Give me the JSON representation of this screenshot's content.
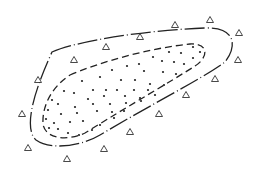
{
  "diagram": {
    "type": "nested-region-sketch",
    "outer_boundary": {
      "style": "dash-dot",
      "path": "M 52 52 C 80 40, 150 30, 205 28 C 235 27, 238 45, 225 62 C 200 80, 150 105, 100 135 C 80 147, 50 150, 36 140 C 25 130, 30 100, 52 52 Z"
    },
    "inner_boundary": {
      "style": "dashed",
      "path": "M 70 75 C 100 62, 150 48, 190 44 C 210 43, 208 58, 195 66 C 170 82, 130 105, 85 133 C 65 142, 45 138, 43 124 C 42 108, 50 88, 70 75 Z"
    },
    "dots": [
      [
        193,
        47
      ],
      [
        200,
        52
      ],
      [
        169,
        52
      ],
      [
        181,
        53
      ],
      [
        153,
        57
      ],
      [
        193,
        58
      ],
      [
        162,
        61
      ],
      [
        174,
        62
      ],
      [
        184,
        64
      ],
      [
        139,
        64
      ],
      [
        112,
        70
      ],
      [
        127,
        66
      ],
      [
        100,
        77
      ],
      [
        121,
        80
      ],
      [
        144,
        71
      ],
      [
        163,
        72
      ],
      [
        176,
        74
      ],
      [
        135,
        80
      ],
      [
        150,
        84
      ],
      [
        82,
        81
      ],
      [
        93,
        90
      ],
      [
        106,
        90
      ],
      [
        117,
        90
      ],
      [
        134,
        90
      ],
      [
        148,
        90
      ],
      [
        164,
        85
      ],
      [
        64,
        91
      ],
      [
        74,
        93
      ],
      [
        88,
        99
      ],
      [
        104,
        96
      ],
      [
        125,
        96
      ],
      [
        140,
        98
      ],
      [
        155,
        95
      ],
      [
        52,
        100
      ],
      [
        58,
        104
      ],
      [
        75,
        107
      ],
      [
        93,
        104
      ],
      [
        110,
        104
      ],
      [
        126,
        103
      ],
      [
        141,
        101
      ],
      [
        48,
        110
      ],
      [
        61,
        114
      ],
      [
        77,
        113
      ],
      [
        97,
        111
      ],
      [
        112,
        112
      ],
      [
        124,
        111
      ],
      [
        46,
        119
      ],
      [
        54,
        123
      ],
      [
        70,
        122
      ],
      [
        83,
        121
      ],
      [
        100,
        125
      ],
      [
        114,
        118
      ],
      [
        49,
        128
      ],
      [
        58,
        129
      ],
      [
        68,
        133
      ],
      [
        79,
        135
      ],
      [
        92,
        130
      ]
    ],
    "triangles": [
      [
        175,
        25
      ],
      [
        210,
        20
      ],
      [
        239,
        33
      ],
      [
        238,
        60
      ],
      [
        215,
        79
      ],
      [
        186,
        95
      ],
      [
        159,
        114
      ],
      [
        130,
        132
      ],
      [
        104,
        149
      ],
      [
        67,
        159
      ],
      [
        28,
        148
      ],
      [
        22,
        114
      ],
      [
        38,
        80
      ],
      [
        74,
        60
      ],
      [
        106,
        47
      ],
      [
        140,
        37
      ]
    ],
    "colors": {
      "stroke": "#222222",
      "background": "#ffffff"
    }
  }
}
